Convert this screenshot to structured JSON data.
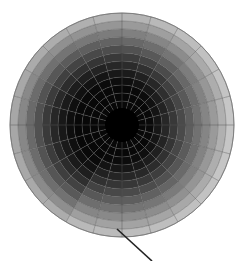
{
  "diagram": {
    "type": "polar-grid-shading-map",
    "background": "#ffffff",
    "grid_color": "#555555",
    "center": {
      "x": 122,
      "y": 125
    },
    "outer_radius": 112,
    "inner_disk_radius": 16,
    "inner_disk_color": "#000000",
    "ring_count": 12,
    "spoke_count": 24,
    "spoke_angle_deg": 15,
    "shade_dark": 8,
    "shade_light": 250,
    "sector_extent": [
      0.3,
      0.33,
      0.38,
      0.45,
      0.52,
      0.58,
      0.62,
      0.66,
      0.7,
      0.74,
      0.78,
      0.8,
      0.8,
      0.78,
      0.76,
      0.72,
      0.52,
      0.48,
      0.46,
      0.44,
      0.4,
      0.36,
      0.32,
      0.3
    ],
    "pointer_line": {
      "x1": 117,
      "y1": 229,
      "x2": 152,
      "y2": 261,
      "color": "#222222",
      "width": 1.6
    }
  }
}
